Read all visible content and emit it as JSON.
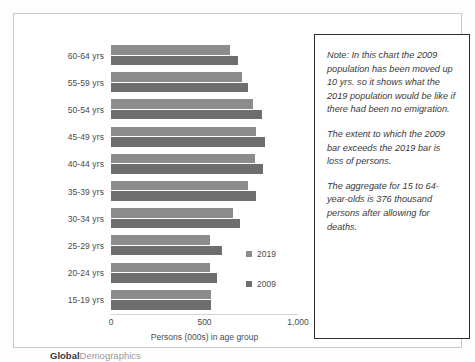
{
  "chart_data": {
    "type": "bar",
    "orientation": "horizontal",
    "title": "",
    "xlabel": "Persons (000s) in age group",
    "ylabel": "",
    "xlim": [
      0,
      1000
    ],
    "xticks": [
      "0",
      "500",
      "1,000"
    ],
    "xtick_values": [
      0,
      500,
      1000
    ],
    "grid": false,
    "legend_position": "inside-right",
    "categories": [
      "60-64 yrs",
      "55-59 yrs",
      "50-54 yrs",
      "45-49 yrs",
      "40-44 yrs",
      "35-39 yrs",
      "30-34 yrs",
      "25-29 yrs",
      "20-24 yrs",
      "15-19 yrs"
    ],
    "series": [
      {
        "name": "2019",
        "color": "#8c8c8c",
        "values": [
          635,
          700,
          760,
          775,
          770,
          735,
          650,
          530,
          530,
          535
        ]
      },
      {
        "name": "2009",
        "color": "#6e6e6e",
        "values": [
          680,
          735,
          810,
          825,
          815,
          775,
          690,
          595,
          565,
          535
        ]
      }
    ]
  },
  "legend": {
    "items": [
      {
        "label": "2019",
        "color": "#8c8c8c"
      },
      {
        "label": "2009",
        "color": "#6e6e6e"
      }
    ]
  },
  "axis": {
    "x_title": "Persons (000s) in age group",
    "ticks": [
      "0",
      "500",
      "1,000"
    ]
  },
  "logo": {
    "bold_part": "Global",
    "light_part": "Demographics"
  },
  "note": {
    "paragraphs": [
      "Note: In this chart the 2009 population has been moved up 10 yrs. so it shows what the 2019 population would be like if there had been no emigration.",
      "The extent to which the 2009 bar exceeds the 2019 bar is loss of persons.",
      "The aggregate for 15 to 64-year-olds is 376 thousand persons after allowing for deaths."
    ]
  }
}
